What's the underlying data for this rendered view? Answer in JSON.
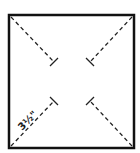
{
  "diagram": {
    "type": "pinwheel-cut-pattern",
    "square": {
      "x": 9,
      "y": 15,
      "width": 125,
      "height": 133,
      "stroke": "#111111",
      "stroke_width": 2.5
    },
    "cut_lines": [
      {
        "id": "top-left",
        "from": [
          10,
          16
        ],
        "to": [
          54,
          62
        ],
        "tick": true
      },
      {
        "id": "top-right",
        "from": [
          133,
          16
        ],
        "to": [
          90,
          62
        ],
        "tick": true
      },
      {
        "id": "bottom-left",
        "from": [
          10,
          147
        ],
        "to": [
          54,
          101
        ],
        "tick": true
      },
      {
        "id": "bottom-right",
        "from": [
          133,
          147
        ],
        "to": [
          90,
          101
        ],
        "tick": true
      }
    ],
    "dimension_label": {
      "text": "3½\"",
      "position": [
        20,
        128
      ],
      "rotation": -45
    },
    "line_color": "#222222",
    "dash": "4,3"
  }
}
